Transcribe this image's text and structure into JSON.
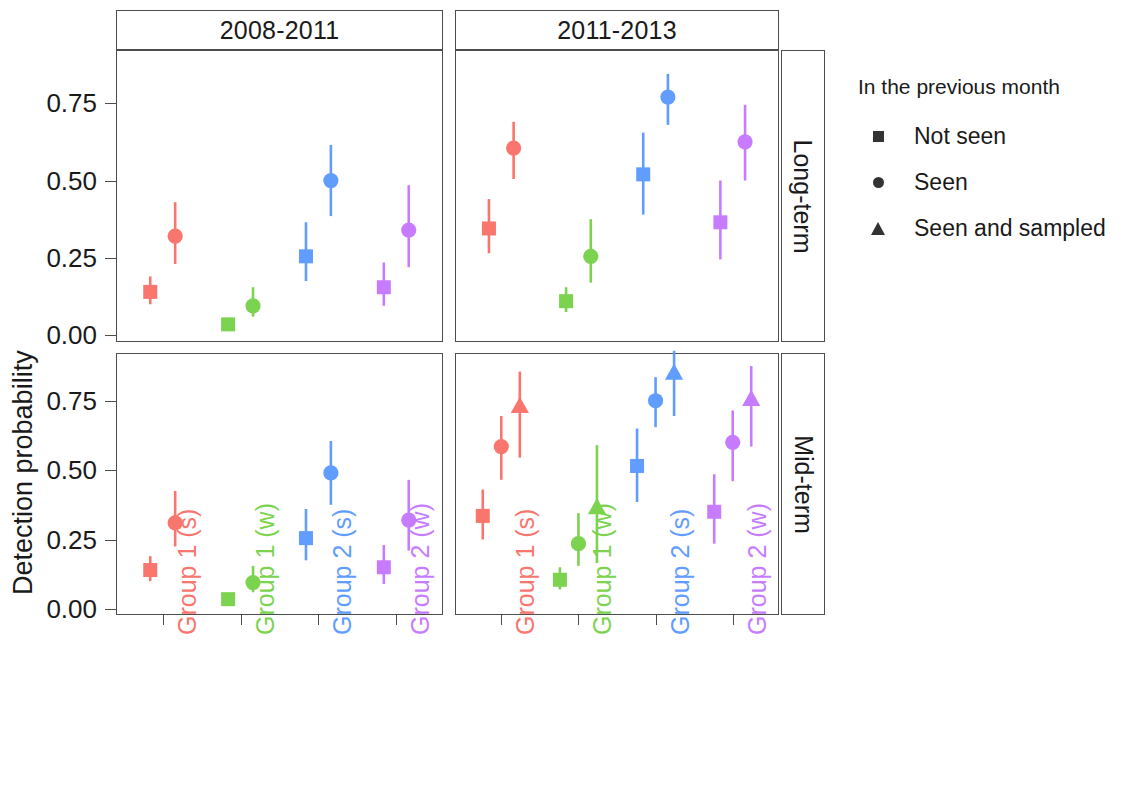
{
  "axis": {
    "y_title": "Detection probability",
    "y_ticks": [
      "0.00",
      "0.25",
      "0.50",
      "0.75"
    ],
    "x_tick_labels": [
      "Group 1 (s)",
      "Group 1 (w)",
      "Group 2 (s)",
      "Group 2 (w)"
    ]
  },
  "facets": {
    "columns": [
      "2008-2011",
      "2011-2013"
    ],
    "rows": [
      "Long-term",
      "Mid-term"
    ]
  },
  "legend": {
    "title": "In the previous month",
    "items": [
      {
        "label": "Not seen",
        "shape": "square"
      },
      {
        "label": "Seen",
        "shape": "circle"
      },
      {
        "label": "Seen and sampled",
        "shape": "triangle"
      }
    ]
  },
  "colors": {
    "group_1_s": "#F8766D",
    "group_1_w": "#7CD34F",
    "group_2_s": "#619CFF",
    "group_2_w": "#C77CFF",
    "axis": "#4d4d4d",
    "text": "#1a1a1a",
    "legend_key": "#333333"
  },
  "chart_data": {
    "type": "scatter",
    "title": "",
    "xlabel": "",
    "ylabel": "Detection probability",
    "ylim": [
      -0.02,
      0.92
    ],
    "grid": false,
    "legend_position": "right",
    "facet_columns": [
      "2008-2011",
      "2011-2013"
    ],
    "facet_rows": [
      "Long-term",
      "Mid-term"
    ],
    "categories": [
      "Group 1 (s)",
      "Group 1 (w)",
      "Group 2 (s)",
      "Group 2 (w)"
    ],
    "category_colors": [
      "#F8766D",
      "#7CD34F",
      "#619CFF",
      "#C77CFF"
    ],
    "series": [
      {
        "name": "Not seen",
        "shape": "square"
      },
      {
        "name": "Seen",
        "shape": "circle"
      },
      {
        "name": "Seen and sampled",
        "shape": "triangle"
      }
    ],
    "panels": [
      {
        "row": "Long-term",
        "column": "2008-2011",
        "points": [
          {
            "group": "Group 1 (s)",
            "series": "Not seen",
            "x": 0.84,
            "y": 0.14,
            "lo": 0.1,
            "hi": 0.19
          },
          {
            "group": "Group 1 (s)",
            "series": "Seen",
            "x": 1.16,
            "y": 0.32,
            "lo": 0.23,
            "hi": 0.43
          },
          {
            "group": "Group 1 (w)",
            "series": "Not seen",
            "x": 1.84,
            "y": 0.035,
            "lo": 0.02,
            "hi": 0.05
          },
          {
            "group": "Group 1 (w)",
            "series": "Seen",
            "x": 2.16,
            "y": 0.095,
            "lo": 0.06,
            "hi": 0.155
          },
          {
            "group": "Group 2 (s)",
            "series": "Not seen",
            "x": 2.84,
            "y": 0.255,
            "lo": 0.175,
            "hi": 0.365
          },
          {
            "group": "Group 2 (s)",
            "series": "Seen",
            "x": 3.16,
            "y": 0.5,
            "lo": 0.385,
            "hi": 0.615
          },
          {
            "group": "Group 2 (w)",
            "series": "Not seen",
            "x": 3.84,
            "y": 0.155,
            "lo": 0.095,
            "hi": 0.235
          },
          {
            "group": "Group 2 (w)",
            "series": "Seen",
            "x": 4.16,
            "y": 0.34,
            "lo": 0.22,
            "hi": 0.485
          }
        ]
      },
      {
        "row": "Long-term",
        "column": "2011-2013",
        "points": [
          {
            "group": "Group 1 (s)",
            "series": "Not seen",
            "x": 0.84,
            "y": 0.345,
            "lo": 0.265,
            "hi": 0.44
          },
          {
            "group": "Group 1 (s)",
            "series": "Seen",
            "x": 1.16,
            "y": 0.605,
            "lo": 0.505,
            "hi": 0.69
          },
          {
            "group": "Group 1 (w)",
            "series": "Not seen",
            "x": 1.84,
            "y": 0.11,
            "lo": 0.075,
            "hi": 0.155
          },
          {
            "group": "Group 1 (w)",
            "series": "Seen",
            "x": 2.16,
            "y": 0.255,
            "lo": 0.17,
            "hi": 0.375
          },
          {
            "group": "Group 2 (s)",
            "series": "Not seen",
            "x": 2.84,
            "y": 0.52,
            "lo": 0.39,
            "hi": 0.655
          },
          {
            "group": "Group 2 (s)",
            "series": "Seen",
            "x": 3.16,
            "y": 0.77,
            "lo": 0.68,
            "hi": 0.845
          },
          {
            "group": "Group 2 (w)",
            "series": "Not seen",
            "x": 3.84,
            "y": 0.365,
            "lo": 0.245,
            "hi": 0.5
          },
          {
            "group": "Group 2 (w)",
            "series": "Seen",
            "x": 4.16,
            "y": 0.625,
            "lo": 0.5,
            "hi": 0.745
          }
        ]
      },
      {
        "row": "Mid-term",
        "column": "2008-2011",
        "points": [
          {
            "group": "Group 1 (s)",
            "series": "Not seen",
            "x": 0.84,
            "y": 0.14,
            "lo": 0.1,
            "hi": 0.19
          },
          {
            "group": "Group 1 (s)",
            "series": "Seen",
            "x": 1.16,
            "y": 0.31,
            "lo": 0.225,
            "hi": 0.425
          },
          {
            "group": "Group 1 (w)",
            "series": "Not seen",
            "x": 1.84,
            "y": 0.035,
            "lo": 0.02,
            "hi": 0.05
          },
          {
            "group": "Group 1 (w)",
            "series": "Seen",
            "x": 2.16,
            "y": 0.095,
            "lo": 0.06,
            "hi": 0.155
          },
          {
            "group": "Group 2 (s)",
            "series": "Not seen",
            "x": 2.84,
            "y": 0.255,
            "lo": 0.175,
            "hi": 0.36
          },
          {
            "group": "Group 2 (s)",
            "series": "Seen",
            "x": 3.16,
            "y": 0.49,
            "lo": 0.375,
            "hi": 0.605
          },
          {
            "group": "Group 2 (w)",
            "series": "Not seen",
            "x": 3.84,
            "y": 0.15,
            "lo": 0.09,
            "hi": 0.23
          },
          {
            "group": "Group 2 (w)",
            "series": "Seen",
            "x": 4.16,
            "y": 0.32,
            "lo": 0.21,
            "hi": 0.465
          }
        ]
      },
      {
        "row": "Mid-term",
        "column": "2011-2013",
        "points": [
          {
            "group": "Group 1 (s)",
            "series": "Not seen",
            "x": 0.76,
            "y": 0.335,
            "lo": 0.25,
            "hi": 0.43
          },
          {
            "group": "Group 1 (s)",
            "series": "Seen",
            "x": 1.0,
            "y": 0.585,
            "lo": 0.465,
            "hi": 0.695
          },
          {
            "group": "Group 1 (s)",
            "series": "Seen and sampled",
            "x": 1.24,
            "y": 0.73,
            "lo": 0.545,
            "hi": 0.855
          },
          {
            "group": "Group 1 (w)",
            "series": "Not seen",
            "x": 1.76,
            "y": 0.105,
            "lo": 0.07,
            "hi": 0.15
          },
          {
            "group": "Group 1 (w)",
            "series": "Seen",
            "x": 2.0,
            "y": 0.235,
            "lo": 0.155,
            "hi": 0.345
          },
          {
            "group": "Group 1 (w)",
            "series": "Seen and sampled",
            "x": 2.24,
            "y": 0.365,
            "lo": 0.165,
            "hi": 0.59
          },
          {
            "group": "Group 2 (s)",
            "series": "Not seen",
            "x": 2.76,
            "y": 0.515,
            "lo": 0.385,
            "hi": 0.65
          },
          {
            "group": "Group 2 (s)",
            "series": "Seen",
            "x": 3.0,
            "y": 0.75,
            "lo": 0.655,
            "hi": 0.835
          },
          {
            "group": "Group 2 (s)",
            "series": "Seen and sampled",
            "x": 3.24,
            "y": 0.85,
            "lo": 0.695,
            "hi": 0.93
          },
          {
            "group": "Group 2 (w)",
            "series": "Not seen",
            "x": 3.76,
            "y": 0.35,
            "lo": 0.235,
            "hi": 0.485
          },
          {
            "group": "Group 2 (w)",
            "series": "Seen",
            "x": 4.0,
            "y": 0.6,
            "lo": 0.46,
            "hi": 0.715
          },
          {
            "group": "Group 2 (w)",
            "series": "Seen and sampled",
            "x": 4.24,
            "y": 0.755,
            "lo": 0.585,
            "hi": 0.875
          }
        ]
      }
    ]
  }
}
